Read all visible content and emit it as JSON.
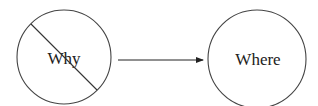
{
  "diagram": {
    "nodes": [
      {
        "id": "why",
        "label": "Why",
        "crossed_out": true
      },
      {
        "id": "where",
        "label": "Where",
        "crossed_out": false
      }
    ],
    "edges": [
      {
        "from": "why",
        "to": "where",
        "style": "arrow"
      }
    ],
    "colors": {
      "stroke": "#333333",
      "text": "#222222",
      "background": "#ffffff"
    }
  }
}
